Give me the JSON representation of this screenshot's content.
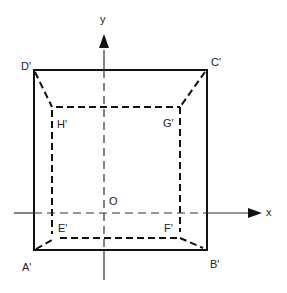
{
  "diagram": {
    "axes": {
      "x_label": "x",
      "y_label": "y",
      "origin_label": "O"
    },
    "outer_square": {
      "labels": {
        "top_left": "D'",
        "top_right": "C'",
        "bottom_left": "A'",
        "bottom_right": "B'"
      },
      "style": "solid"
    },
    "inner_square": {
      "labels": {
        "top_left": "H'",
        "top_right": "G'",
        "bottom_left": "E'",
        "bottom_right": "F'"
      },
      "style": "dashed"
    },
    "colors": {
      "line": "#111111",
      "axis": "#333333",
      "background": "#ffffff"
    }
  }
}
